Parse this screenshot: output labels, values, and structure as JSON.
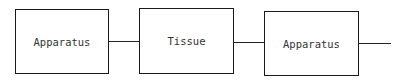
{
  "diagram": {
    "nodes": [
      {
        "id": "apparatus-1",
        "label": "Apparatus"
      },
      {
        "id": "tissue",
        "label": "Tissue"
      },
      {
        "id": "apparatus-2",
        "label": "Apparatus"
      }
    ],
    "edges": [
      {
        "from": "apparatus-1",
        "to": "tissue"
      },
      {
        "from": "tissue",
        "to": "apparatus-2"
      },
      {
        "from": "apparatus-2",
        "to": "open-end"
      }
    ]
  }
}
